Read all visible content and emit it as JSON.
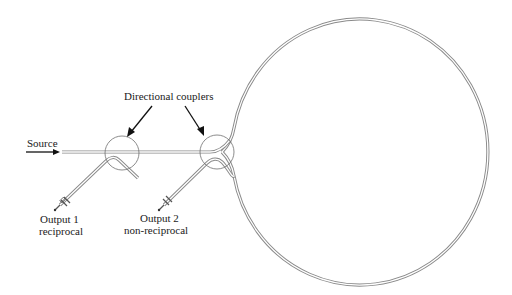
{
  "diagram": {
    "labels": {
      "source": "Source",
      "couplers": "Directional couplers",
      "output1_line1": "Output 1",
      "output1_line2": "reciprocal",
      "output2_line1": "Output 2",
      "output2_line2": "non-reciprocal"
    },
    "colors": {
      "background": "#ffffff",
      "waveguide": "#8a8a8a",
      "coupler_circle": "#6e6e6e",
      "arrow": "#111111",
      "text": "#1a1a1a"
    },
    "elements": [
      "source-arrow",
      "input-waveguide",
      "directional-coupler-1",
      "directional-coupler-2",
      "output-1-fiber",
      "output-2-fiber",
      "fiber-loop"
    ]
  }
}
